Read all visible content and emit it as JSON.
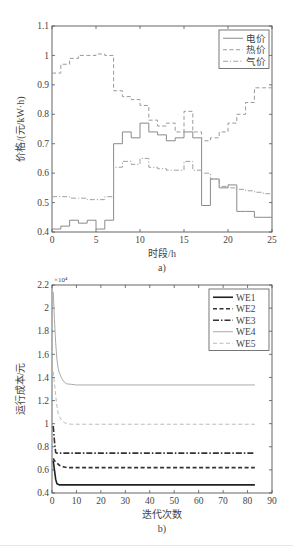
{
  "chart_data": [
    {
      "id": "a",
      "type": "line",
      "step": true,
      "caption": "a)",
      "title": "",
      "xlabel": "时段/h",
      "ylabel": "价格/(元/kW·h)",
      "xlim": [
        0,
        25
      ],
      "ylim": [
        0.4,
        1.1
      ],
      "xticks": [
        0,
        5,
        10,
        15,
        20,
        25
      ],
      "yticks": [
        0.4,
        0.5,
        0.6,
        0.7,
        0.8,
        0.9,
        1,
        1.1
      ],
      "ytick_labels": [
        "0.4",
        "0.5",
        "0.6",
        "0.7",
        "0.8",
        "0.9",
        "1",
        "1.1"
      ],
      "grid": false,
      "legend_position": "upper right",
      "x": [
        0,
        1,
        2,
        3,
        4,
        5,
        6,
        7,
        8,
        9,
        10,
        11,
        12,
        13,
        14,
        15,
        16,
        17,
        18,
        19,
        20,
        21,
        22,
        23,
        24
      ],
      "series": [
        {
          "name": "电价",
          "style": "solid",
          "color": "#8a8a8a",
          "values": [
            0.41,
            0.42,
            0.44,
            0.43,
            0.44,
            0.41,
            0.44,
            0.7,
            0.74,
            0.72,
            0.77,
            0.74,
            0.73,
            0.71,
            0.72,
            0.74,
            0.72,
            0.49,
            0.58,
            0.55,
            0.56,
            0.47,
            0.47,
            0.45,
            0.45
          ]
        },
        {
          "name": "热价",
          "style": "dashed",
          "color": "#9a9a9a",
          "values": [
            0.94,
            0.97,
            0.99,
            1.0,
            1.0,
            1.005,
            1.0,
            0.88,
            0.86,
            0.85,
            0.83,
            0.78,
            0.76,
            0.77,
            0.74,
            0.81,
            0.74,
            0.71,
            0.72,
            0.74,
            0.77,
            0.8,
            0.84,
            0.89,
            0.89
          ]
        },
        {
          "name": "气价",
          "style": "dashdot",
          "color": "#a0a0a0",
          "values": [
            0.52,
            0.52,
            0.515,
            0.515,
            0.51,
            0.51,
            0.52,
            0.62,
            0.64,
            0.63,
            0.65,
            0.62,
            0.615,
            0.61,
            0.61,
            0.64,
            0.61,
            0.6,
            0.58,
            0.555,
            0.55,
            0.545,
            0.54,
            0.535,
            0.53
          ]
        }
      ]
    },
    {
      "id": "b",
      "type": "line",
      "step": false,
      "caption": "b)",
      "title": "",
      "xlabel": "迭代次数",
      "ylabel": "运行成本/元",
      "y_multiplier": "×10⁴",
      "xlim": [
        0,
        90
      ],
      "ylim": [
        0.4,
        2.2
      ],
      "xticks": [
        0,
        10,
        20,
        30,
        40,
        50,
        60,
        70,
        80,
        90
      ],
      "yticks": [
        0.4,
        0.6,
        0.8,
        1,
        1.2,
        1.4,
        1.6,
        1.8,
        2,
        2.2
      ],
      "ytick_labels": [
        "0.4",
        "0.6",
        "0.8",
        "1",
        "1.2",
        "1.4",
        "1.6",
        "1.8",
        "2",
        "2.2"
      ],
      "grid": false,
      "legend_position": "upper right",
      "x": [
        0.5,
        1,
        1.5,
        2,
        2.5,
        3,
        4,
        5,
        6,
        8,
        10,
        20,
        40,
        60,
        83
      ],
      "series": [
        {
          "name": "WE1",
          "style": "solid-bold",
          "color": "#222222",
          "values": [
            0.68,
            0.6,
            0.52,
            0.48,
            0.475,
            0.47,
            0.47,
            0.47,
            0.47,
            0.47,
            0.47,
            0.47,
            0.47,
            0.47,
            0.47
          ]
        },
        {
          "name": "WE2",
          "style": "dashed-bold",
          "color": "#333333",
          "values": [
            0.7,
            0.68,
            0.67,
            0.66,
            0.65,
            0.64,
            0.63,
            0.625,
            0.62,
            0.62,
            0.62,
            0.62,
            0.62,
            0.62,
            0.62
          ]
        },
        {
          "name": "WE3",
          "style": "dashdot-bold",
          "color": "#333333",
          "values": [
            0.98,
            0.85,
            0.75,
            0.745,
            0.745,
            0.745,
            0.745,
            0.745,
            0.745,
            0.745,
            0.745,
            0.745,
            0.745,
            0.745,
            0.745
          ]
        },
        {
          "name": "WE4",
          "style": "solid",
          "color": "#aaaaaa",
          "values": [
            2.14,
            1.9,
            1.7,
            1.56,
            1.48,
            1.44,
            1.39,
            1.36,
            1.345,
            1.34,
            1.335,
            1.335,
            1.335,
            1.335,
            1.335
          ]
        },
        {
          "name": "WE5",
          "style": "dashed",
          "color": "#bbbbbb",
          "values": [
            1.45,
            1.35,
            1.25,
            1.15,
            1.09,
            1.06,
            1.03,
            1.01,
            1.0,
            0.995,
            0.995,
            0.995,
            0.995,
            0.995,
            0.995
          ]
        }
      ]
    }
  ]
}
